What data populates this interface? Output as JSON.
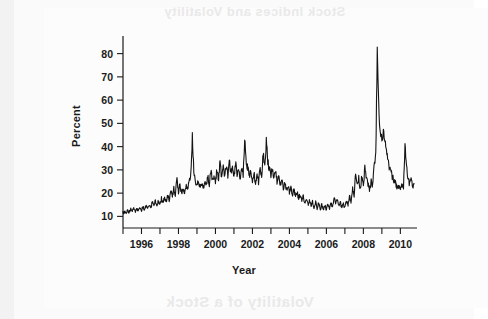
{
  "page": {
    "bleed_through_top": "Stock Indices and Volatility",
    "bleed_through_bottom": "Volatility of a Stock"
  },
  "chart_data": {
    "type": "line",
    "title": "",
    "xlabel": "Year",
    "ylabel": "Percent",
    "xlim": [
      1995.0,
      2010.9
    ],
    "ylim": [
      5,
      85
    ],
    "grid": false,
    "legend": null,
    "x_major_ticks": [
      1996,
      1998,
      2000,
      2002,
      2004,
      2006,
      2008,
      2010
    ],
    "x_major_tick_labels": [
      "1996",
      "1998",
      "2000",
      "2002",
      "2004",
      "2006",
      "2008",
      "2010"
    ],
    "x_minor_ticks": [
      1995,
      1997,
      1999,
      2001,
      2003,
      2005,
      2007,
      2009
    ],
    "y_ticks": [
      10,
      20,
      30,
      40,
      50,
      60,
      70,
      80
    ],
    "y_tick_labels": [
      "10",
      "20",
      "30",
      "40",
      "50",
      "60",
      "70",
      "80"
    ],
    "line_color": "#141414",
    "line_width": 1.1,
    "series": [
      {
        "name": "Volatility",
        "x": [
          1995.0,
          1995.08,
          1995.17,
          1995.25,
          1995.33,
          1995.42,
          1995.5,
          1995.58,
          1995.67,
          1995.75,
          1995.83,
          1995.92,
          1996.0,
          1996.08,
          1996.17,
          1996.25,
          1996.33,
          1996.42,
          1996.5,
          1996.58,
          1996.67,
          1996.75,
          1996.83,
          1996.92,
          1997.0,
          1997.08,
          1997.17,
          1997.25,
          1997.33,
          1997.42,
          1997.5,
          1997.58,
          1997.67,
          1997.75,
          1997.83,
          1997.92,
          1998.0,
          1998.08,
          1998.17,
          1998.25,
          1998.33,
          1998.42,
          1998.5,
          1998.58,
          1998.67,
          1998.75,
          1998.83,
          1998.92,
          1999.0,
          1999.08,
          1999.17,
          1999.25,
          1999.33,
          1999.42,
          1999.5,
          1999.58,
          1999.67,
          1999.75,
          1999.83,
          1999.92,
          2000.0,
          2000.08,
          2000.17,
          2000.25,
          2000.33,
          2000.42,
          2000.5,
          2000.58,
          2000.67,
          2000.75,
          2000.83,
          2000.92,
          2001.0,
          2001.08,
          2001.17,
          2001.25,
          2001.33,
          2001.42,
          2001.5,
          2001.58,
          2001.67,
          2001.75,
          2001.83,
          2001.92,
          2002.0,
          2002.08,
          2002.17,
          2002.25,
          2002.33,
          2002.42,
          2002.5,
          2002.58,
          2002.67,
          2002.75,
          2002.83,
          2002.92,
          2003.0,
          2003.08,
          2003.17,
          2003.25,
          2003.33,
          2003.42,
          2003.5,
          2003.58,
          2003.67,
          2003.75,
          2003.83,
          2003.92,
          2004.0,
          2004.08,
          2004.17,
          2004.25,
          2004.33,
          2004.42,
          2004.5,
          2004.58,
          2004.67,
          2004.75,
          2004.83,
          2004.92,
          2005.0,
          2005.08,
          2005.17,
          2005.25,
          2005.33,
          2005.42,
          2005.5,
          2005.58,
          2005.67,
          2005.75,
          2005.83,
          2005.92,
          2006.0,
          2006.08,
          2006.17,
          2006.25,
          2006.33,
          2006.42,
          2006.5,
          2006.58,
          2006.67,
          2006.75,
          2006.83,
          2006.92,
          2007.0,
          2007.08,
          2007.17,
          2007.25,
          2007.33,
          2007.42,
          2007.5,
          2007.58,
          2007.67,
          2007.75,
          2007.83,
          2007.92,
          2008.0,
          2008.08,
          2008.17,
          2008.25,
          2008.33,
          2008.42,
          2008.5,
          2008.58,
          2008.67,
          2008.75,
          2008.83,
          2008.92,
          2009.0,
          2009.08,
          2009.17,
          2009.25,
          2009.33,
          2009.42,
          2009.5,
          2009.58,
          2009.67,
          2009.75,
          2009.83,
          2009.92,
          2010.0,
          2010.08,
          2010.17,
          2010.25,
          2010.33,
          2010.42,
          2010.5,
          2010.58,
          2010.67,
          2010.75
        ],
        "values": [
          11.5,
          12.0,
          11.2,
          12.6,
          11.8,
          13.0,
          12.2,
          13.4,
          12.0,
          13.2,
          12.4,
          13.8,
          12.6,
          14.2,
          13.0,
          15.0,
          13.4,
          14.4,
          13.6,
          16.0,
          14.6,
          17.2,
          15.0,
          16.4,
          15.2,
          17.6,
          15.8,
          18.2,
          16.4,
          19.0,
          17.0,
          21.5,
          18.4,
          22.6,
          19.4,
          26.0,
          20.8,
          23.4,
          20.2,
          22.0,
          19.6,
          24.0,
          21.0,
          25.5,
          28.0,
          44.5,
          30.0,
          25.0,
          22.5,
          26.0,
          22.0,
          24.5,
          21.5,
          25.0,
          22.4,
          27.0,
          24.0,
          29.5,
          25.5,
          27.5,
          24.5,
          30.0,
          26.0,
          33.5,
          27.0,
          31.0,
          26.5,
          32.0,
          27.5,
          34.5,
          28.5,
          30.5,
          27.0,
          33.0,
          28.0,
          30.0,
          26.5,
          31.5,
          28.0,
          43.5,
          33.0,
          30.5,
          27.5,
          29.5,
          25.5,
          28.5,
          24.5,
          27.5,
          25.0,
          30.5,
          27.0,
          37.0,
          32.0,
          42.5,
          34.0,
          30.0,
          27.5,
          31.0,
          26.5,
          29.0,
          25.0,
          27.0,
          23.5,
          25.5,
          22.5,
          24.0,
          21.5,
          23.0,
          20.5,
          22.5,
          19.5,
          21.5,
          18.5,
          20.5,
          17.5,
          19.5,
          16.5,
          18.5,
          15.5,
          17.5,
          15.0,
          17.0,
          14.5,
          16.5,
          14.0,
          16.0,
          13.5,
          15.5,
          13.0,
          15.0,
          13.2,
          14.6,
          13.0,
          15.2,
          13.5,
          16.0,
          14.0,
          18.5,
          15.0,
          17.0,
          14.2,
          16.0,
          13.8,
          15.5,
          13.5,
          16.5,
          15.0,
          19.0,
          16.5,
          22.0,
          18.0,
          29.5,
          23.0,
          26.5,
          22.0,
          27.5,
          24.0,
          30.5,
          26.0,
          24.0,
          21.5,
          25.0,
          23.0,
          31.0,
          36.0,
          80.0,
          56.0,
          44.0,
          43.0,
          47.0,
          41.0,
          38.0,
          33.0,
          31.0,
          28.5,
          27.0,
          25.0,
          24.5,
          22.0,
          23.5,
          21.0,
          24.0,
          22.0,
          41.0,
          32.0,
          26.0,
          23.5,
          28.0,
          22.5,
          24.0
        ]
      }
    ]
  }
}
